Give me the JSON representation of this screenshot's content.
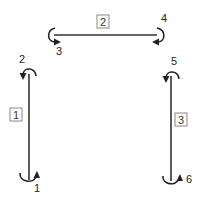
{
  "diagram": {
    "type": "structural frame members with end moment directions",
    "colors": {
      "line": "#333333",
      "label_box_border": "#888888",
      "background": "#ffffff"
    },
    "members": [
      {
        "id": "1",
        "orientation": "vertical",
        "position": "left"
      },
      {
        "id": "2",
        "orientation": "horizontal",
        "position": "top"
      },
      {
        "id": "3",
        "orientation": "vertical",
        "position": "right"
      }
    ],
    "end_moments": [
      {
        "id": "1",
        "member": "1",
        "end": "bottom",
        "rotation": "counterclockwise"
      },
      {
        "id": "2",
        "member": "1",
        "end": "top",
        "rotation": "counterclockwise"
      },
      {
        "id": "3",
        "member": "2",
        "end": "left",
        "rotation": "counterclockwise"
      },
      {
        "id": "4",
        "member": "2",
        "end": "right",
        "rotation": "clockwise"
      },
      {
        "id": "5",
        "member": "3",
        "end": "top",
        "rotation": "counterclockwise"
      },
      {
        "id": "6",
        "member": "3",
        "end": "bottom",
        "rotation": "counterclockwise"
      }
    ]
  }
}
